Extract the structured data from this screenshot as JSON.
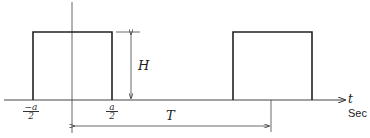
{
  "diagram": {
    "type": "periodic rectangular pulse train",
    "labels": {
      "height": "H",
      "period": "T",
      "time_axis": "t",
      "time_unit": "Sec",
      "left_edge_num": "−a",
      "left_edge_den": "2",
      "right_edge_num": "a",
      "right_edge_den": "2"
    },
    "colors": {
      "stroke": "#222222",
      "background": "#ffffff"
    }
  }
}
